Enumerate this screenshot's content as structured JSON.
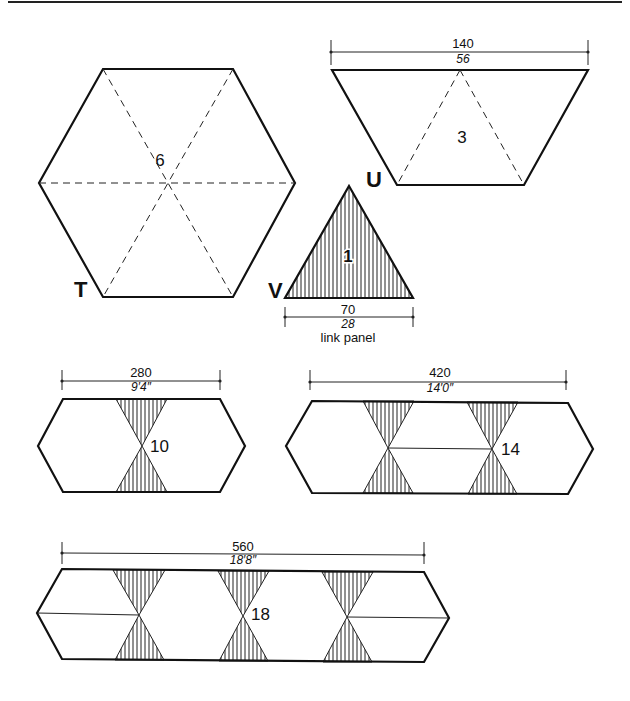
{
  "figure": {
    "shapes": [
      {
        "id": "T",
        "label": "T",
        "panel_count": "6",
        "type": "hexagon"
      },
      {
        "id": "U",
        "label": "U",
        "panel_count": "3",
        "type": "trapezoid",
        "dim_top": "140",
        "dim_bottom": "56"
      },
      {
        "id": "V",
        "label": "V",
        "panel_count": "1",
        "type": "triangle",
        "dim_top": "70",
        "dim_bottom": "28",
        "caption": "link panel"
      }
    ],
    "assemblies": [
      {
        "panel_count": "10",
        "dim_top": "280",
        "dim_bottom": "9′4″"
      },
      {
        "panel_count": "14",
        "dim_top": "420",
        "dim_bottom": "14′0″"
      },
      {
        "panel_count": "18",
        "dim_top": "560",
        "dim_bottom": "18′8″"
      }
    ]
  }
}
